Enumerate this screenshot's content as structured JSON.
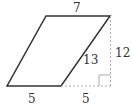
{
  "diagram": {
    "type": "parallelogram-with-height",
    "labels": {
      "top_side": "7",
      "slant_side": "13",
      "height": "12",
      "bottom_side": "5",
      "extension": "5"
    },
    "colors": {
      "stroke": "#333333",
      "dashed": "#aaaaaa"
    }
  }
}
